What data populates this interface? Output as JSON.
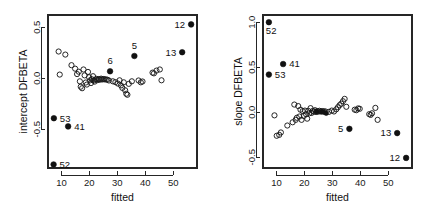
{
  "figure": {
    "background": "#ffffff",
    "foreground": "#1a1a1a",
    "panel_count": 2
  },
  "chart_data": [
    {
      "type": "scatter",
      "panel": "left",
      "title": "",
      "xlabel": "fitted",
      "ylabel": "intercept DFBETA",
      "xlim": [
        5.2,
        58.5
      ],
      "ylim": [
        -0.88,
        0.62
      ],
      "xticks": [
        10,
        20,
        30,
        40,
        50
      ],
      "xticklabels": [
        "10",
        "20",
        "30",
        "40",
        "50"
      ],
      "yticks": [
        0.5,
        0.0,
        -0.5
      ],
      "yticklabels": [
        "0.5",
        "0.0",
        "-0.5"
      ],
      "grid": false,
      "legend": null,
      "series": [
        {
          "name": "unlabeled observations",
          "marker": "open-circle",
          "points": [
            [
              9.0,
              0.262
            ],
            [
              9.4,
              0.036
            ],
            [
              11.4,
              0.232
            ],
            [
              13.6,
              0.128
            ],
            [
              14.9,
              0.094
            ],
            [
              15.6,
              0.041
            ],
            [
              16.2,
              0.064
            ],
            [
              16.6,
              -0.03
            ],
            [
              16.9,
              -0.083
            ],
            [
              17.4,
              -0.098
            ],
            [
              17.9,
              0.086
            ],
            [
              18.3,
              0.028
            ],
            [
              18.7,
              -0.042
            ],
            [
              19.1,
              -0.062
            ],
            [
              19.5,
              0.062
            ],
            [
              19.9,
              0.01
            ],
            [
              20.3,
              -0.02
            ],
            [
              20.6,
              -0.047
            ],
            [
              20.9,
              -0.01
            ],
            [
              21.3,
              0.02
            ],
            [
              21.6,
              -0.022
            ],
            [
              21.9,
              -0.033
            ],
            [
              22.3,
              -0.012
            ],
            [
              22.6,
              -0.006
            ],
            [
              23.0,
              -0.018
            ],
            [
              23.4,
              -0.008
            ],
            [
              23.8,
              -0.014
            ],
            [
              24.2,
              -0.004
            ],
            [
              24.6,
              -0.012
            ],
            [
              25.0,
              -0.008
            ],
            [
              25.4,
              -0.01
            ],
            [
              25.9,
              -0.012
            ],
            [
              26.4,
              -0.014
            ],
            [
              27.0,
              -0.022
            ],
            [
              28.4,
              -0.03
            ],
            [
              29.3,
              -0.038
            ],
            [
              30.2,
              -0.052
            ],
            [
              30.8,
              -0.02
            ],
            [
              31.3,
              -0.07
            ],
            [
              31.8,
              -0.095
            ],
            [
              32.3,
              -0.04
            ],
            [
              32.8,
              -0.118
            ],
            [
              33.2,
              -0.152
            ],
            [
              33.6,
              -0.162
            ],
            [
              34.1,
              -0.055
            ],
            [
              35.2,
              -0.03
            ],
            [
              37.6,
              -0.022
            ],
            [
              38.4,
              -0.04
            ],
            [
              39.0,
              -0.032
            ],
            [
              42.6,
              0.055
            ],
            [
              43.1,
              0.048
            ],
            [
              44.0,
              0.075
            ],
            [
              45.2,
              0.086
            ],
            [
              45.8,
              -0.02
            ]
          ]
        },
        {
          "name": "highlighted observations",
          "marker": "solid-circle",
          "points": [
            {
              "id": "12",
              "x": 56.4,
              "y": 0.528,
              "label_side": "left"
            },
            {
              "id": "13",
              "x": 53.2,
              "y": 0.255,
              "label_side": "left"
            },
            {
              "id": "5",
              "x": 36.1,
              "y": 0.218,
              "label_side": "above"
            },
            {
              "id": "6",
              "x": 27.4,
              "y": 0.068,
              "label_side": "above"
            },
            {
              "id": "53",
              "x": 7.3,
              "y": -0.392,
              "label_side": "right"
            },
            {
              "id": "41",
              "x": 12.4,
              "y": -0.472,
              "label_side": "right"
            },
            {
              "id": "52",
              "x": 7.2,
              "y": -0.845,
              "label_side": "right"
            }
          ]
        }
      ]
    },
    {
      "type": "scatter",
      "panel": "right",
      "title": "",
      "xlabel": "fitted",
      "ylabel": "slope DFBETA",
      "xlim": [
        5.2,
        58.5
      ],
      "ylim": [
        -0.62,
        1.08
      ],
      "xticks": [
        10,
        20,
        30,
        40,
        50
      ],
      "xticklabels": [
        "10",
        "20",
        "30",
        "40",
        "50"
      ],
      "yticks": [
        1.0,
        0.5,
        0.0,
        -0.5
      ],
      "yticklabels": [
        "1.0",
        "0.5",
        "0.0",
        "-0.5"
      ],
      "grid": false,
      "legend": null,
      "series": [
        {
          "name": "unlabeled observations",
          "marker": "open-circle",
          "points": [
            [
              9.3,
              -0.035
            ],
            [
              10.1,
              -0.262
            ],
            [
              11.0,
              -0.252
            ],
            [
              11.6,
              -0.225
            ],
            [
              13.9,
              -0.148
            ],
            [
              15.8,
              -0.112
            ],
            [
              16.4,
              0.085
            ],
            [
              16.9,
              -0.085
            ],
            [
              17.3,
              -0.062
            ],
            [
              17.8,
              0.068
            ],
            [
              18.2,
              -0.048
            ],
            [
              18.6,
              0.028
            ],
            [
              19.0,
              -0.085
            ],
            [
              19.4,
              0.012
            ],
            [
              19.8,
              -0.042
            ],
            [
              20.2,
              0.018
            ],
            [
              20.6,
              -0.022
            ],
            [
              21.0,
              -0.072
            ],
            [
              21.4,
              0.015
            ],
            [
              21.8,
              -0.012
            ],
            [
              22.2,
              0.045
            ],
            [
              22.6,
              -0.008
            ],
            [
              23.0,
              0.014
            ],
            [
              23.4,
              0.006
            ],
            [
              23.8,
              0.022
            ],
            [
              24.2,
              0.002
            ],
            [
              24.6,
              0.012
            ],
            [
              25.0,
              0.006
            ],
            [
              25.4,
              0.016
            ],
            [
              25.9,
              0.008
            ],
            [
              26.4,
              0.012
            ],
            [
              27.0,
              0.01
            ],
            [
              27.6,
              0.008
            ],
            [
              28.8,
              0.004
            ],
            [
              29.8,
              0.018
            ],
            [
              30.6,
              0.008
            ],
            [
              31.4,
              0.032
            ],
            [
              32.0,
              0.055
            ],
            [
              32.6,
              0.078
            ],
            [
              33.2,
              0.095
            ],
            [
              33.8,
              0.122
            ],
            [
              34.4,
              0.148
            ],
            [
              35.0,
              0.06
            ],
            [
              38.0,
              0.028
            ],
            [
              38.6,
              0.022
            ],
            [
              39.2,
              0.042
            ],
            [
              39.8,
              0.038
            ],
            [
              43.2,
              -0.022
            ],
            [
              43.7,
              -0.03
            ],
            [
              44.2,
              -0.012
            ],
            [
              45.4,
              0.048
            ],
            [
              46.2,
              -0.085
            ]
          ]
        },
        {
          "name": "highlighted observations",
          "marker": "solid-circle",
          "points": [
            {
              "id": "52",
              "x": 7.3,
              "y": 1.0,
              "label_side": "below"
            },
            {
              "id": "41",
              "x": 12.4,
              "y": 0.535,
              "label_side": "right"
            },
            {
              "id": "53",
              "x": 7.3,
              "y": 0.418,
              "label_side": "right"
            },
            {
              "id": "5",
              "x": 36.1,
              "y": -0.185,
              "label_side": "left"
            },
            {
              "id": "13",
              "x": 53.2,
              "y": -0.232,
              "label_side": "left"
            },
            {
              "id": "12",
              "x": 56.4,
              "y": -0.508,
              "label_side": "left"
            }
          ]
        },
        {
          "name": "cluster overlap markers",
          "marker": "solid-circle-small",
          "points": [
            {
              "x": 26.2,
              "y": 0.004
            },
            {
              "x": 27.0,
              "y": 0.0
            },
            {
              "x": 27.8,
              "y": -0.012
            },
            {
              "x": 24.4,
              "y": 0.008
            }
          ]
        }
      ]
    }
  ]
}
